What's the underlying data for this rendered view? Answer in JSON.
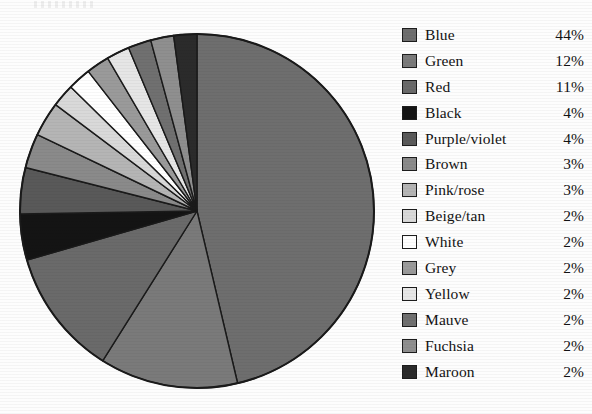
{
  "chart_data": {
    "type": "pie",
    "title": "",
    "start_angle_deg": 0,
    "direction": "clockwise",
    "legend_position": "right",
    "unit": "%",
    "categories": [
      "Blue",
      "Green",
      "Red",
      "Black",
      "Purple/violet",
      "Brown",
      "Pink/rose",
      "Beige/tan",
      "White",
      "Grey",
      "Yellow",
      "Mauve",
      "Fuchsia",
      "Maroon"
    ],
    "values": [
      44,
      12,
      11,
      4,
      4,
      3,
      3,
      2,
      2,
      2,
      2,
      2,
      2,
      2
    ],
    "value_labels": [
      "44%",
      "12%",
      "11%",
      "4%",
      "4%",
      "3%",
      "3%",
      "2%",
      "2%",
      "2%",
      "2%",
      "2%",
      "2%",
      "2%"
    ],
    "slice_colors": [
      "#6e6e6e",
      "#7a7a7a",
      "#6a6a6a",
      "#141414",
      "#595959",
      "#8a8a8a",
      "#b5b5b5",
      "#d9d9d9",
      "#ffffff",
      "#9a9a9a",
      "#e6e6e6",
      "#707070",
      "#8f8f8f",
      "#2b2b2b"
    ],
    "slice_outline_color": "#1a1a1a",
    "xlabel": "",
    "ylabel": ""
  },
  "legend": {
    "rows": [
      {
        "label": "Blue",
        "value": "44%",
        "swatch": "#6e6e6e"
      },
      {
        "label": "Green",
        "value": "12%",
        "swatch": "#7a7a7a"
      },
      {
        "label": "Red",
        "value": "11%",
        "swatch": "#6a6a6a"
      },
      {
        "label": "Black",
        "value": "4%",
        "swatch": "#141414"
      },
      {
        "label": "Purple/violet",
        "value": "4%",
        "swatch": "#595959"
      },
      {
        "label": "Brown",
        "value": "3%",
        "swatch": "#8a8a8a"
      },
      {
        "label": "Pink/rose",
        "value": "3%",
        "swatch": "#b5b5b5"
      },
      {
        "label": "Beige/tan",
        "value": "2%",
        "swatch": "#d9d9d9"
      },
      {
        "label": "White",
        "value": "2%",
        "swatch": "#ffffff"
      },
      {
        "label": "Grey",
        "value": "2%",
        "swatch": "#9a9a9a"
      },
      {
        "label": "Yellow",
        "value": "2%",
        "swatch": "#e6e6e6"
      },
      {
        "label": "Mauve",
        "value": "2%",
        "swatch": "#707070"
      },
      {
        "label": "Fuchsia",
        "value": "2%",
        "swatch": "#8f8f8f"
      },
      {
        "label": "Maroon",
        "value": "2%",
        "swatch": "#2b2b2b"
      }
    ]
  },
  "pie_geometry": {
    "center_x": 197,
    "center_y": 211,
    "radius": 177
  }
}
